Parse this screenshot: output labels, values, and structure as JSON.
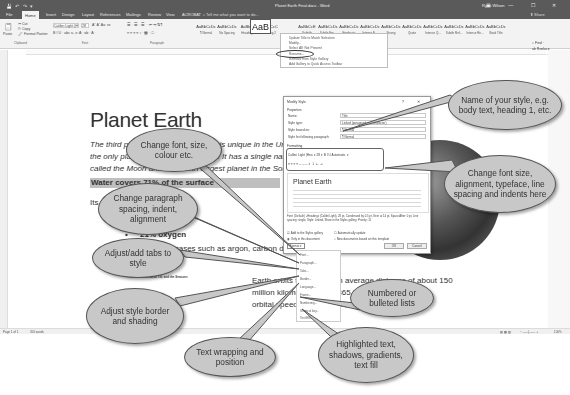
{
  "window": {
    "title": "Planet Earth Final.docx - Word",
    "user": "Ryan Wilson",
    "quick_access": "💾 ↶ ↷ ▾",
    "window_buttons": "▣ — ☐ ✕"
  },
  "ribbon": {
    "tabs": [
      "File",
      "Home",
      "Insert",
      "Design",
      "Layout",
      "References",
      "Mailings",
      "Review",
      "View",
      "ACROBAT"
    ],
    "active_tab": "Home",
    "tell_me": "⌕ Tell me what you want to do...",
    "share": "⬆ Share",
    "clipboard": {
      "paste": "Paste",
      "cut": "✂ Cut",
      "copy": "⎘ Copy",
      "format_painter": "🖌 Format Painter",
      "label": "Clipboard"
    },
    "font": {
      "name": "Calibri Light (H",
      "size": "28",
      "row2": "B I U · abc x₂ x²  A · ab · A ·",
      "label": "Font"
    },
    "paragraph": {
      "row1": "☰ · ☰ · ☰ ·  ⇤ ⇥  ⇅  ¶",
      "row2": "≡ ≡ ≡ ≡  ↕ ·  ▦ ·  □ ·",
      "label": "Paragraph"
    },
    "styles": [
      {
        "sample": "AaBbCcDc",
        "name": "¶ Normal"
      },
      {
        "sample": "AaBbCcDc",
        "name": "No Spacing"
      },
      {
        "sample": "AaBbCc",
        "name": "Heading 1"
      },
      {
        "sample": "AaBbCcC",
        "name": "Heading 2"
      },
      {
        "sample": "AaB",
        "name": "Title"
      },
      {
        "sample": "AaBbCcE",
        "name": "Subtitle"
      },
      {
        "sample": "AaBbCcDc",
        "name": "Subtle Em..."
      },
      {
        "sample": "AaBbCcDc",
        "name": "Emphasis"
      },
      {
        "sample": "AaBbCcDc",
        "name": "Intense E..."
      },
      {
        "sample": "AaBbCcDc",
        "name": "Strong"
      },
      {
        "sample": "AaBbCcDc",
        "name": "Quote"
      },
      {
        "sample": "AaBbCcDc",
        "name": "Intense Q..."
      },
      {
        "sample": "AaBbCcDc",
        "name": "Subtle Ref..."
      },
      {
        "sample": "AaBbCcDc",
        "name": "Intense Re..."
      },
      {
        "sample": "AaBbCcDc",
        "name": "Book Title"
      }
    ],
    "styles_label": "Styles",
    "editing": {
      "find": "⌕ Find ·",
      "replace": "ab Replace",
      "select": "↳ Select ·",
      "label": "Editing"
    }
  },
  "style_menu": {
    "items": [
      "Update Title to Match Selection",
      "Modify...",
      "Select All: Not Present",
      "Rename...",
      "Remove from Style Gallery",
      "Add Gallery to Quick Access Toolbar"
    ]
  },
  "document": {
    "title": "Planet Earth",
    "intro_lines": [
      "The third planet from the Sun, Earth is unique in the Universe as",
      "the only planet known to support life. It has a single natural satellite",
      "called the Moon and is the fifth largest planet in the Solar System."
    ],
    "shaded_heading": "Water covers 71% of the surface",
    "its_line": "Its atmosphere consists of:",
    "bullet_nitrogen": "78% nitrogen",
    "bullet_oxygen": "21% oxygen",
    "other_gases": "1% other gases such as argon, carbon dioxide",
    "caption": "Earth's Orbit, Axial Tilt, and the Seasons",
    "orbit_lines": [
      "Earth orbits the Sun at an average distance of about 150",
      "million kilometres every 365.24 days and has an",
      "orbital speed of about 107,000 kilometres per"
    ]
  },
  "status_bar": {
    "page": "Page 1 of 1",
    "words": "301 words",
    "zoom": "100%"
  },
  "dialog": {
    "title": "Modify Style",
    "buttons": "? ✕",
    "properties_label": "Properties",
    "fields": [
      {
        "label": "Name:",
        "value": "Title"
      },
      {
        "label": "Style type:",
        "value": "Linked (paragraph and character)"
      },
      {
        "label": "Style based on:",
        "value": "¶ Normal"
      },
      {
        "label": "Style for following paragraph:",
        "value": "¶ Normal"
      }
    ],
    "formatting_label": "Formatting",
    "font_row": "Calibri Light (Hea ▾  28 ▾   B  I  U    Automatic ▾",
    "align_row": "≡  ≡  ≡  ≡   ═  ═  ═   ↥  ↧   ⇤  ⇥",
    "preview_title": "Planet Earth",
    "description": "Font: (Default) +Headings (Calibri Light), 28 pt, Condensed by 0.5 pt, Kern at 14 pt, Space After: 0 pt, Line spacing: single, Style: Linked, Show in the Styles gallery, Priority: 11",
    "add_to_gallery": "Add to the Styles gallery",
    "auto_update": "Automatically update",
    "only_this_doc": "Only in this document",
    "new_docs": "New documents based on this template",
    "format_button": "Format ▾",
    "ok": "OK",
    "cancel": "Cancel"
  },
  "format_menu": {
    "items": [
      "Font...",
      "Paragraph...",
      "Tabs...",
      "Border...",
      "Language...",
      "Frame...",
      "Numbering...",
      "Shortcut key...",
      "Text Effects..."
    ]
  },
  "callouts": [
    {
      "id": "font",
      "text": "Change font, size, colour etc."
    },
    {
      "id": "paragraph",
      "text": "Change paragraph spacing, indent, alignment"
    },
    {
      "id": "tabs",
      "text": "Adjust/add tabs to style"
    },
    {
      "id": "border",
      "text": "Adjust style border and shading"
    },
    {
      "id": "frame",
      "text": "Text wrapping and position"
    },
    {
      "id": "numbering",
      "text": "Numbered or bulleted lists"
    },
    {
      "id": "effects",
      "text": "Highlighted text, shadows, gradients, text fill"
    },
    {
      "id": "name",
      "text": "Name of your style, e.g. body text, heading 1, etc."
    },
    {
      "id": "formatting",
      "text": "Change font size, alignment, typeface, line spacing and indents here"
    }
  ]
}
